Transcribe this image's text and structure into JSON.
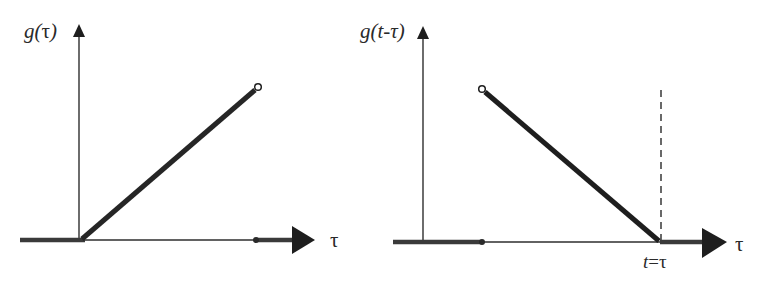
{
  "diagram": {
    "type": "signal-plots",
    "colors": {
      "ink": "#1e1e1e",
      "thin": "#3a3a3a",
      "background": "#ffffff"
    },
    "left_plot": {
      "y_label": "g(τ)",
      "y_label_parts": {
        "fn": "g",
        "open": "(",
        "arg": "τ",
        "close": ")"
      },
      "x_label": "τ",
      "description": "Ramp g(τ) starting at origin, zero for τ<0, ending with open circle"
    },
    "right_plot": {
      "y_label": "g(t-τ)",
      "y_label_parts": {
        "fn": "g",
        "open": "(",
        "arg": "t-τ",
        "close": ")"
      },
      "x_label": "τ",
      "marker_label": "t=τ",
      "marker_label_parts": {
        "lhs": "t",
        "eq": "=",
        "rhs": "τ"
      },
      "description": "Time-reversed shifted ramp g(t-τ), decreasing to zero at τ=t, dashed line at t"
    }
  }
}
